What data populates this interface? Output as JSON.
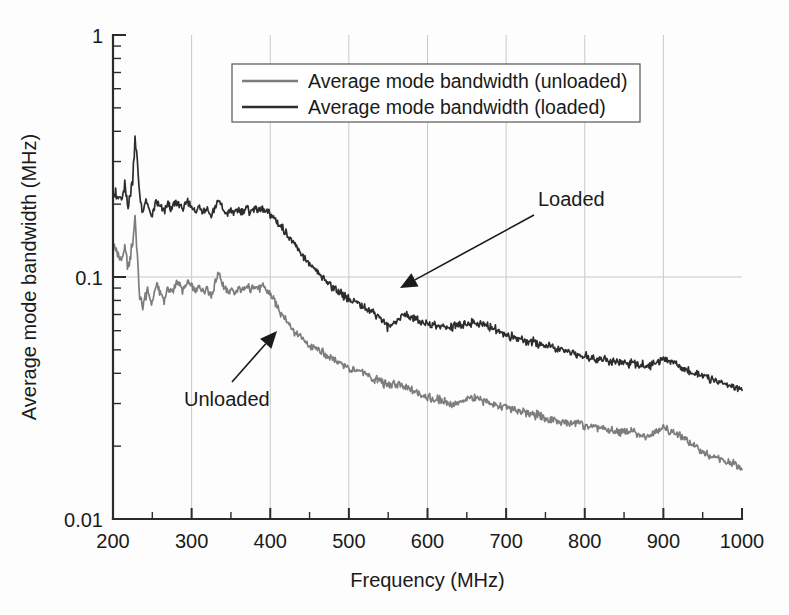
{
  "figure": {
    "background_color": "#fdfdfd",
    "plot_area": {
      "left": 113,
      "top": 35,
      "right": 742,
      "bottom": 519
    }
  },
  "chart_data": {
    "type": "line",
    "title": "",
    "xlabel": "Frequency (MHz)",
    "ylabel": "Average mode bandwidth (MHz)",
    "xlim": [
      200,
      1000
    ],
    "ylim": [
      0.01,
      1
    ],
    "yscale": "log",
    "xscale": "linear",
    "grid": true,
    "grid_x_at": [
      300,
      400,
      500,
      600,
      700,
      800,
      900
    ],
    "grid_y_at": [
      0.1
    ],
    "xticks": [
      200,
      300,
      400,
      500,
      600,
      700,
      800,
      900,
      1000
    ],
    "xtick_labels": [
      "200",
      "300",
      "400",
      "500",
      "600",
      "700",
      "800",
      "900",
      "1000"
    ],
    "x_minor_tick_step": 50,
    "yticks": [
      0.01,
      0.1,
      1
    ],
    "ytick_labels": [
      "0.01",
      "0.1",
      "1"
    ],
    "legend_position": "upper-center",
    "series": [
      {
        "name": "Average mode bandwidth (unloaded)",
        "short_name": "Unloaded",
        "color": "#7d7d7d",
        "x": [
          200,
          205,
          210,
          215,
          220,
          225,
          228,
          231,
          234,
          238,
          242,
          246,
          250,
          255,
          260,
          265,
          270,
          275,
          280,
          285,
          290,
          295,
          300,
          305,
          310,
          315,
          320,
          325,
          330,
          335,
          340,
          345,
          350,
          355,
          360,
          365,
          370,
          375,
          380,
          385,
          390,
          395,
          400,
          405,
          410,
          415,
          420,
          425,
          430,
          435,
          440,
          445,
          450,
          455,
          460,
          465,
          470,
          475,
          480,
          485,
          490,
          495,
          500,
          510,
          520,
          530,
          540,
          550,
          560,
          570,
          580,
          590,
          600,
          610,
          620,
          630,
          640,
          650,
          660,
          670,
          680,
          690,
          700,
          710,
          720,
          730,
          740,
          750,
          760,
          770,
          780,
          790,
          800,
          810,
          820,
          830,
          840,
          850,
          860,
          870,
          880,
          890,
          900,
          910,
          920,
          930,
          940,
          950,
          960,
          970,
          980,
          990,
          1000
        ],
        "y": [
          0.135,
          0.128,
          0.118,
          0.131,
          0.11,
          0.14,
          0.175,
          0.12,
          0.082,
          0.074,
          0.088,
          0.083,
          0.079,
          0.093,
          0.087,
          0.081,
          0.09,
          0.086,
          0.095,
          0.092,
          0.088,
          0.096,
          0.091,
          0.086,
          0.092,
          0.087,
          0.09,
          0.083,
          0.095,
          0.105,
          0.092,
          0.086,
          0.089,
          0.086,
          0.09,
          0.087,
          0.091,
          0.088,
          0.093,
          0.089,
          0.092,
          0.088,
          0.085,
          0.08,
          0.074,
          0.07,
          0.066,
          0.063,
          0.06,
          0.058,
          0.056,
          0.054,
          0.052,
          0.051,
          0.05,
          0.049,
          0.048,
          0.047,
          0.046,
          0.045,
          0.044,
          0.043,
          0.042,
          0.041,
          0.04,
          0.038,
          0.037,
          0.036,
          0.036,
          0.035,
          0.034,
          0.033,
          0.032,
          0.031,
          0.031,
          0.03,
          0.03,
          0.031,
          0.032,
          0.031,
          0.03,
          0.029,
          0.029,
          0.028,
          0.028,
          0.027,
          0.027,
          0.026,
          0.026,
          0.025,
          0.025,
          0.025,
          0.024,
          0.024,
          0.024,
          0.023,
          0.023,
          0.023,
          0.023,
          0.022,
          0.022,
          0.023,
          0.024,
          0.023,
          0.022,
          0.021,
          0.02,
          0.019,
          0.018,
          0.018,
          0.017,
          0.017,
          0.016
        ]
      },
      {
        "name": "Average mode bandwidth (loaded)",
        "short_name": "Loaded",
        "color": "#2d2d2d",
        "x": [
          200,
          205,
          210,
          215,
          220,
          225,
          228,
          231,
          234,
          238,
          242,
          246,
          250,
          255,
          260,
          265,
          270,
          275,
          280,
          285,
          290,
          295,
          300,
          305,
          310,
          315,
          320,
          325,
          330,
          335,
          340,
          345,
          350,
          355,
          360,
          365,
          370,
          375,
          380,
          385,
          390,
          395,
          400,
          405,
          410,
          415,
          420,
          425,
          430,
          435,
          440,
          445,
          450,
          455,
          460,
          465,
          470,
          475,
          480,
          485,
          490,
          495,
          500,
          510,
          520,
          530,
          540,
          550,
          560,
          570,
          580,
          590,
          600,
          610,
          620,
          630,
          640,
          650,
          660,
          670,
          680,
          690,
          700,
          710,
          720,
          730,
          740,
          750,
          760,
          770,
          780,
          790,
          800,
          810,
          820,
          830,
          840,
          850,
          860,
          870,
          880,
          890,
          900,
          910,
          920,
          930,
          940,
          950,
          960,
          970,
          980,
          990,
          1000
        ],
        "y": [
          0.225,
          0.215,
          0.205,
          0.235,
          0.2,
          0.255,
          0.38,
          0.3,
          0.215,
          0.185,
          0.205,
          0.192,
          0.18,
          0.205,
          0.195,
          0.186,
          0.2,
          0.192,
          0.205,
          0.198,
          0.19,
          0.205,
          0.195,
          0.183,
          0.196,
          0.188,
          0.192,
          0.178,
          0.196,
          0.208,
          0.19,
          0.182,
          0.19,
          0.183,
          0.192,
          0.185,
          0.193,
          0.186,
          0.195,
          0.188,
          0.193,
          0.186,
          0.182,
          0.175,
          0.168,
          0.16,
          0.152,
          0.145,
          0.138,
          0.13,
          0.124,
          0.118,
          0.112,
          0.108,
          0.104,
          0.1,
          0.097,
          0.094,
          0.091,
          0.088,
          0.086,
          0.083,
          0.081,
          0.078,
          0.075,
          0.072,
          0.068,
          0.062,
          0.066,
          0.07,
          0.068,
          0.066,
          0.064,
          0.063,
          0.062,
          0.062,
          0.063,
          0.064,
          0.065,
          0.064,
          0.062,
          0.06,
          0.058,
          0.056,
          0.055,
          0.054,
          0.053,
          0.052,
          0.051,
          0.05,
          0.049,
          0.048,
          0.047,
          0.046,
          0.046,
          0.045,
          0.045,
          0.044,
          0.044,
          0.043,
          0.043,
          0.044,
          0.046,
          0.045,
          0.043,
          0.041,
          0.04,
          0.039,
          0.038,
          0.037,
          0.036,
          0.035,
          0.034
        ]
      }
    ],
    "annotations": [
      {
        "text": "Loaded",
        "text_x": 538,
        "text_y": 206,
        "arrow_from_x": 534,
        "arrow_from_y": 215,
        "arrow_to_x": 400,
        "arrow_to_y": 288
      },
      {
        "text": "Unloaded",
        "text_x": 184,
        "text_y": 406,
        "arrow_from_x": 232,
        "arrow_from_y": 382,
        "arrow_to_x": 277,
        "arrow_to_y": 331
      }
    ],
    "legend": {
      "box_x": 232,
      "box_y": 64,
      "box_width": 408,
      "box_height": 58,
      "entries": [
        {
          "label": "Average mode bandwidth (unloaded)",
          "color": "#7d7d7d"
        },
        {
          "label": "Average mode bandwidth (loaded)",
          "color": "#2d2d2d"
        }
      ]
    }
  }
}
